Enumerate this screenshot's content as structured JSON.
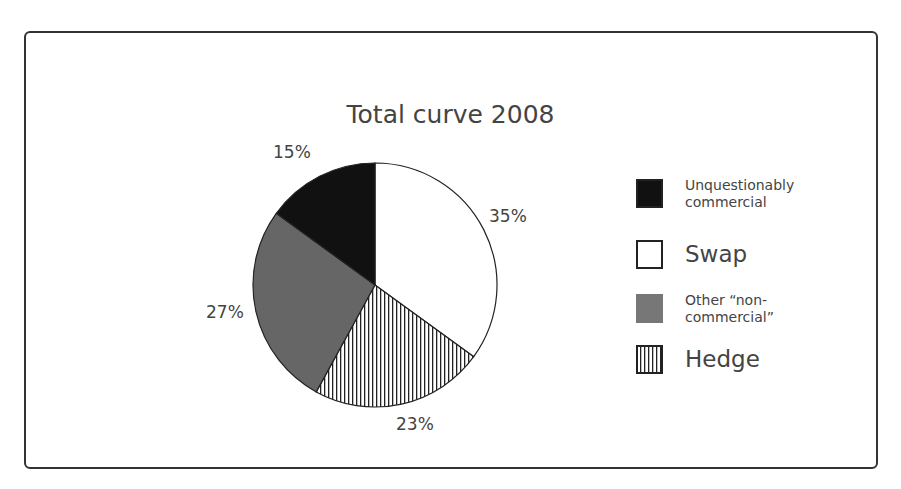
{
  "chart_data": {
    "type": "pie",
    "title": "Total curve 2008",
    "slices": [
      {
        "label": "Unquestionably commercial",
        "value": 15,
        "display": "15%",
        "color": "#111111",
        "pattern": "solid"
      },
      {
        "label": "Swap",
        "value": 35,
        "display": "35%",
        "color": "#ffffff",
        "pattern": "solid"
      },
      {
        "label": "Hedge",
        "value": 23,
        "display": "23%",
        "color": "#ffffff",
        "pattern": "vertical-stripes"
      },
      {
        "label": "Other “non-commercial”",
        "value": 27,
        "display": "27%",
        "color": "#666666",
        "pattern": "solid"
      }
    ],
    "legend": [
      {
        "label": "Unquestionably commercial",
        "line1": "Unquestionably",
        "line2": "commercial"
      },
      {
        "label": "Swap"
      },
      {
        "label": "Other “non-commercial”",
        "line1": "Other “non-",
        "line2": "commercial”"
      },
      {
        "label": "Hedge"
      }
    ],
    "legend_position": "right"
  }
}
